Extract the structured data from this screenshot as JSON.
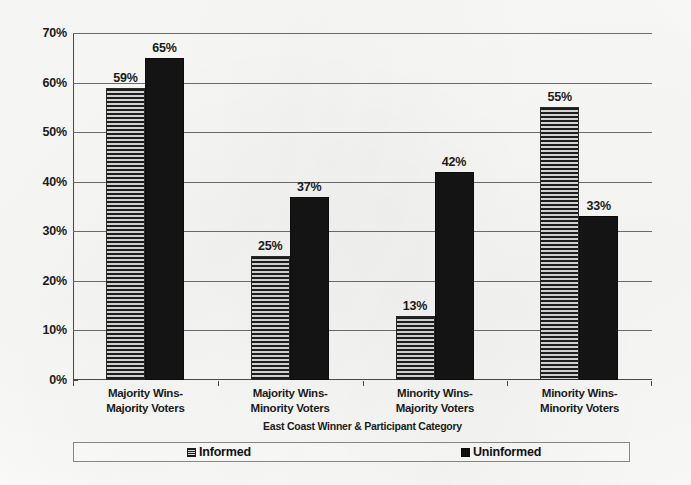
{
  "chart_data": {
    "type": "bar",
    "title": "",
    "xlabel": "East Coast Winner & Participant Category",
    "ylabel": "",
    "ylim": [
      0,
      70
    ],
    "grid": true,
    "legend_position": "bottom",
    "categories": [
      "Majority Wins-\nMajority Voters",
      "Majority Wins-\nMinority Voters",
      "Minority Wins-\nMajority Voters",
      "Minority Wins-\nMinority Voters"
    ],
    "category_lines": [
      [
        "Majority Wins-",
        "Majority Voters"
      ],
      [
        "Majority Wins-",
        "Minority Voters"
      ],
      [
        "Minority Wins-",
        "Majority Voters"
      ],
      [
        "Minority Wins-",
        "Minority Voters"
      ]
    ],
    "series": [
      {
        "name": "Informed",
        "values": [
          59,
          25,
          13,
          55
        ],
        "labels": [
          "59%",
          "25%",
          "13%",
          "55%"
        ],
        "fill": "horizontal-stripes",
        "color": "#8d8d8d"
      },
      {
        "name": "Uninformed",
        "values": [
          65,
          37,
          42,
          33
        ],
        "labels": [
          "65%",
          "37%",
          "42%",
          "33%"
        ],
        "fill": "solid",
        "color": "#141414"
      }
    ],
    "ytick_values": [
      0,
      10,
      20,
      30,
      40,
      50,
      60,
      70
    ],
    "ytick_labels": [
      "0%",
      "10%",
      "20%",
      "30%",
      "40%",
      "50%",
      "60%",
      "70%"
    ]
  },
  "legend": {
    "items": [
      {
        "label": "Informed",
        "swatch": "striped-square-icon"
      },
      {
        "label": "Uninformed",
        "swatch": "filled-square-icon"
      }
    ]
  }
}
